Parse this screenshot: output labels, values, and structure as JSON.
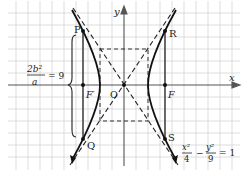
{
  "diagram": {
    "type": "hyperbola",
    "equation": {
      "x_num": "x²",
      "x_den": "4",
      "minus": "−",
      "y_num": "y²",
      "y_den": "9",
      "eq": "= 1"
    },
    "latus_rectum": {
      "num": "2b²",
      "den": "a",
      "eq": "= 9"
    },
    "points": {
      "P": "P",
      "Q": "Q",
      "R": "R",
      "S": "S",
      "F": "F",
      "F_prime": "F′",
      "O": "O"
    },
    "axes": {
      "x": "x",
      "y": "y"
    },
    "colors": {
      "grid": "#c8c8c8",
      "curve": "#1a1a1a",
      "axis": "#555555"
    }
  }
}
